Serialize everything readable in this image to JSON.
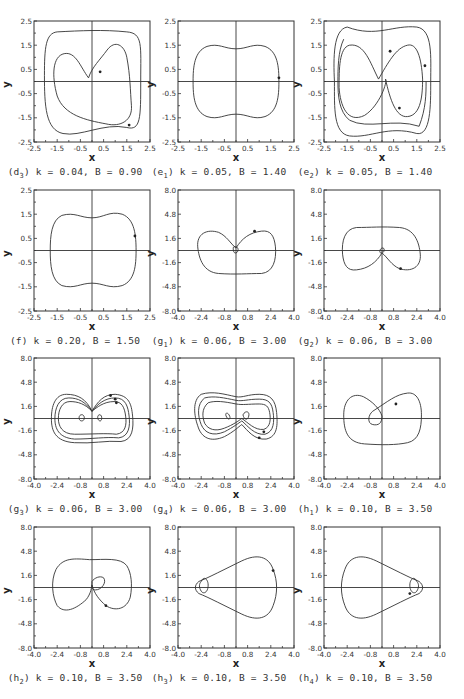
{
  "figure": {
    "layout": {
      "columns": 3,
      "rows": 4
    },
    "panels": [
      {
        "id": "d3",
        "label": "d",
        "sub": "3",
        "k": "0.04",
        "B": "0.90",
        "caption": "k = 0.04, B = 0.90",
        "xticks": [
          "-2.5",
          "-1.5",
          "-0.5",
          "0.5",
          "1.5",
          "2.5"
        ],
        "yticks": [
          "2.5",
          "1.5",
          "0.5",
          "-0.5",
          "-1.5",
          "-2.5"
        ]
      },
      {
        "id": "e1",
        "label": "e",
        "sub": "1",
        "k": "0.05",
        "B": "1.40",
        "caption": "k = 0.05, B = 1.40",
        "xticks": [
          "-2.5",
          "-1.5",
          "-0.5",
          "0.5",
          "1.5",
          "2.5"
        ],
        "yticks": [
          "2.5",
          "1.5",
          "0.5",
          "-0.5",
          "-1.5",
          "-2.5"
        ]
      },
      {
        "id": "e2",
        "label": "e",
        "sub": "2",
        "k": "0.05",
        "B": "1.40",
        "caption": "k = 0.05, B = 1.40",
        "xticks": [
          "-2.5",
          "-1.5",
          "-0.5",
          "0.5",
          "1.5",
          "2.5"
        ],
        "yticks": [
          "2.5",
          "1.5",
          "0.5",
          "-0.5",
          "-1.5",
          "-2.5"
        ]
      },
      {
        "id": "f",
        "label": "f",
        "sub": "",
        "k": "0.20",
        "B": "1.50",
        "caption": "k = 0.20, B = 1.50",
        "xticks": [
          "-2.5",
          "-1.5",
          "-0.5",
          "0.5",
          "1.5",
          "2.5"
        ],
        "yticks": [
          "2.5",
          "1.5",
          "0.5",
          "-0.5",
          "-1.5",
          "-2.5"
        ]
      },
      {
        "id": "g1",
        "label": "g",
        "sub": "1",
        "k": "0.06",
        "B": "3.00",
        "caption": "k = 0.06, B = 3.00",
        "xticks": [
          "-4.0",
          "-2.4",
          "-0.8",
          "0.8",
          "2.4",
          "4.0"
        ],
        "yticks": [
          "8.0",
          "4.8",
          "1.6",
          "-1.6",
          "-4.8",
          "-8.0"
        ]
      },
      {
        "id": "g2",
        "label": "g",
        "sub": "2",
        "k": "0.06",
        "B": "3.00",
        "caption": "k = 0.06, B = 3.00",
        "xticks": [
          "-4.0",
          "-2.4",
          "-0.8",
          "0.8",
          "2.4",
          "4.0"
        ],
        "yticks": [
          "8.0",
          "4.8",
          "1.6",
          "-1.6",
          "-4.8",
          "-8.0"
        ]
      },
      {
        "id": "g3",
        "label": "g",
        "sub": "3",
        "k": "0.06",
        "B": "3.00",
        "caption": "k = 0.06, B = 3.00",
        "xticks": [
          "-4.0",
          "-2.4",
          "-0.8",
          "0.8",
          "2.4",
          "4.0"
        ],
        "yticks": [
          "8.0",
          "4.8",
          "1.6",
          "-1.6",
          "-4.8",
          "-8.0"
        ]
      },
      {
        "id": "g4",
        "label": "g",
        "sub": "4",
        "k": "0.06",
        "B": "3.00",
        "caption": "k = 0.06, B = 3.00",
        "xticks": [
          "-4.0",
          "-2.4",
          "-0.8",
          "0.8",
          "2.4",
          "4.0"
        ],
        "yticks": [
          "8.0",
          "4.8",
          "1.6",
          "-1.6",
          "-4.8",
          "-8.0"
        ]
      },
      {
        "id": "h1",
        "label": "h",
        "sub": "1",
        "k": "0.10",
        "B": "3.50",
        "caption": "k = 0.10, B = 3.50",
        "xticks": [
          "-4.0",
          "-2.4",
          "-0.8",
          "0.8",
          "2.4",
          "4.0"
        ],
        "yticks": [
          "8.0",
          "4.8",
          "1.6",
          "-1.6",
          "-4.8",
          "-8.0"
        ]
      },
      {
        "id": "h2",
        "label": "h",
        "sub": "2",
        "k": "0.10",
        "B": "3.50",
        "caption": "k = 0.10, B = 3.50",
        "xticks": [
          "-4.0",
          "-2.4",
          "-0.8",
          "0.8",
          "2.4",
          "4.0"
        ],
        "yticks": [
          "8.0",
          "4.8",
          "1.6",
          "-1.6",
          "-4.8",
          "-8.0"
        ]
      },
      {
        "id": "h3",
        "label": "h",
        "sub": "3",
        "k": "0.10",
        "B": "3.50",
        "caption": "k = 0.10, B = 3.50",
        "xticks": [
          "-4.0",
          "-2.4",
          "-0.8",
          "0.8",
          "2.4",
          "4.0"
        ],
        "yticks": [
          "8.0",
          "4.8",
          "1.6",
          "-1.6",
          "-4.8",
          "-8.0"
        ]
      },
      {
        "id": "h4",
        "label": "h",
        "sub": "4",
        "k": "0.10",
        "B": "3.50",
        "caption": "k = 0.10, B = 3.50",
        "xticks": [
          "-4.0",
          "-2.4",
          "-0.8",
          "0.8",
          "2.4",
          "4.0"
        ],
        "yticks": [
          "8.0",
          "4.8",
          "1.6",
          "-1.6",
          "-4.8",
          "-8.0"
        ]
      }
    ],
    "axis_labels": {
      "x": "x",
      "y": "y"
    }
  },
  "chart_data": [
    {
      "type": "line",
      "title": "(d3) k = 0.04, B = 0.90",
      "xlabel": "x",
      "ylabel": "y",
      "xlim": [
        -2.5,
        2.5
      ],
      "ylim": [
        -2.5,
        2.5
      ],
      "grid": false,
      "description": "phase portrait: outer rounded-square orbit (|x|~1.9, |y|~2.2) plus inner heart-shaped loop crossing near (0.2,-1.8)"
    },
    {
      "type": "line",
      "title": "(e1) k = 0.05, B = 1.40",
      "xlabel": "x",
      "ylabel": "y",
      "xlim": [
        -2.5,
        2.5
      ],
      "ylim": [
        -2.5,
        2.5
      ],
      "grid": false,
      "description": "single closed peanut-shaped orbit, x in [-1.7,1.7], y in [-1.4,1.4], pinched to ~1.1 at x=0"
    },
    {
      "type": "line",
      "title": "(e2) k = 0.05, B = 1.40",
      "xlabel": "x",
      "ylabel": "y",
      "xlim": [
        -2.5,
        2.5
      ],
      "ylim": [
        -2.5,
        2.5
      ],
      "grid": false,
      "description": "multi-loop orbit: outer rounded square to |y|~2.4 with crossings, inner figure-eight lobes"
    },
    {
      "type": "line",
      "title": "(f) k = 0.20, B = 1.50",
      "xlabel": "x",
      "ylabel": "y",
      "xlim": [
        -2.5,
        2.5
      ],
      "ylim": [
        -2.5,
        2.5
      ],
      "grid": false,
      "description": "single peanut-shaped orbit, x in [-1.6,1.7], y in [-1.4,1.4]"
    },
    {
      "type": "line",
      "title": "(g1) k = 0.06, B = 3.00",
      "xlabel": "x",
      "ylabel": "y",
      "xlim": [
        -4.0,
        4.0
      ],
      "ylim": [
        -8.0,
        8.0
      ],
      "grid": false,
      "description": "heart-shaped orbit with small loop at origin, x in [-2.3,2.2], y in [-3.2,2.8]"
    },
    {
      "type": "line",
      "title": "(g2) k = 0.06, B = 3.00",
      "xlabel": "x",
      "ylabel": "y",
      "xlim": [
        -4.0,
        4.0
      ],
      "ylim": [
        -8.0,
        8.0
      ],
      "grid": false,
      "description": "mirrored heart orbit with small loop near origin, x in [-2.3,2.3], y in [-2.8,3.0]"
    },
    {
      "type": "line",
      "title": "(g3) k = 0.06, B = 3.00",
      "xlabel": "x",
      "ylabel": "y",
      "xlim": [
        -4.0,
        4.0
      ],
      "ylim": [
        -8.0,
        8.0
      ],
      "grid": false,
      "description": "three nested figure-eight orbits, x in [-2.4,2.4], y in [-3.2,3.2]"
    },
    {
      "type": "line",
      "title": "(g4) k = 0.06, B = 3.00",
      "xlabel": "x",
      "ylabel": "y",
      "xlim": [
        -4.0,
        4.0
      ],
      "ylim": [
        -8.0,
        8.0
      ],
      "grid": false,
      "description": "three nested figure-eight orbits with small inner loops, x in [-2.4,2.4], y in [-3.4,3.4]"
    },
    {
      "type": "line",
      "title": "(h1) k = 0.10, B = 3.50",
      "xlabel": "x",
      "ylabel": "y",
      "xlim": [
        -4.0,
        4.0
      ],
      "ylim": [
        -8.0,
        8.0
      ],
      "grid": false,
      "description": "large loop with inner small loop left of origin, x in [-2.5,2.5], y in [-4.0,3.5]"
    },
    {
      "type": "line",
      "title": "(h2) k = 0.10, B = 3.50",
      "xlabel": "x",
      "ylabel": "y",
      "xlim": [
        -4.0,
        4.0
      ],
      "ylim": [
        -8.0,
        8.0
      ],
      "grid": false,
      "description": "large loop with inner small loop right of origin, x in [-2.5,2.5], y in [-3.6,3.8]"
    },
    {
      "type": "line",
      "title": "(h3) k = 0.10, B = 3.50",
      "xlabel": "x",
      "ylabel": "y",
      "xlim": [
        -4.0,
        4.0
      ],
      "ylim": [
        -8.0,
        8.0
      ],
      "grid": false,
      "description": "teardrop orbit pointing left with small loop at x~-1.3, x in [-1.8,2.5], y in [-3.6,3.6]"
    },
    {
      "type": "line",
      "title": "(h4) k = 0.10, B = 3.50",
      "xlabel": "x",
      "ylabel": "y",
      "xlim": [
        -4.0,
        4.0
      ],
      "ylim": [
        -8.0,
        8.0
      ],
      "grid": false,
      "description": "teardrop orbit pointing right with small loop at x~1.3, x in [-2.5,1.8], y in [-3.6,3.6]"
    }
  ]
}
